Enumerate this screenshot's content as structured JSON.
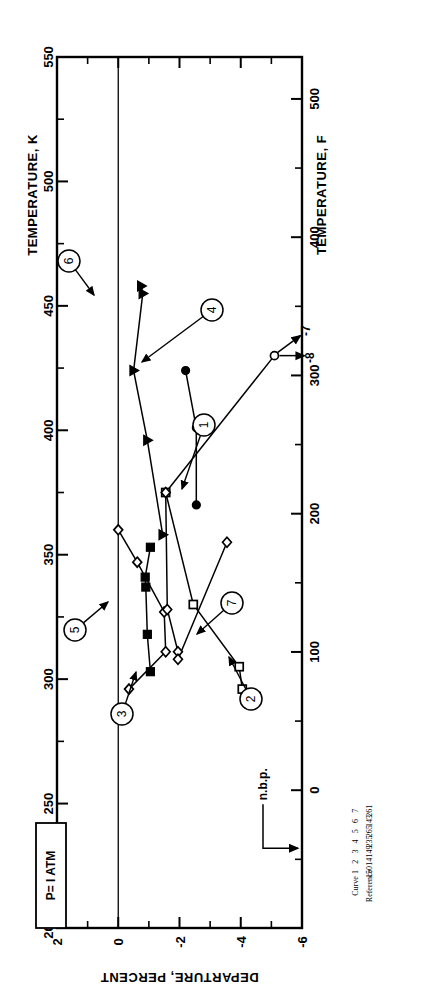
{
  "figure": {
    "orientation": "rotated-90-ccw",
    "pressure_note": "P= I ATM",
    "nbp_label": "n.b.p.",
    "extra_arrow_labels": [
      "-7",
      "-8"
    ]
  },
  "axes": {
    "kelvin": {
      "title": "TEMPERATURE, K",
      "ticks": [
        "200",
        "250",
        "300",
        "350",
        "400",
        "450",
        "500",
        "550"
      ],
      "min": 200,
      "max": 550,
      "minor_step": 25
    },
    "fahrenheit": {
      "title": "TEMPERATURE, F",
      "ticks": [
        "0",
        "100",
        "200",
        "300",
        "400",
        "500"
      ],
      "min": -100,
      "max": 530,
      "minor_step": 50
    },
    "departure": {
      "title": "DEPARTURE, PERCENT",
      "ticks": [
        "2",
        "0",
        "-2",
        "-4",
        "-6"
      ],
      "min": -6,
      "max": 2,
      "minor_step": 1
    }
  },
  "legend_table": {
    "headers": [
      "Curve",
      "Reference"
    ],
    "rows": [
      {
        "curve": "1",
        "reference": "150"
      },
      {
        "curve": "2",
        "reference": "14"
      },
      {
        "curve": "3",
        "reference": "149"
      },
      {
        "curve": "4",
        "reference": "235"
      },
      {
        "curve": "5",
        "reference": "265"
      },
      {
        "curve": "6",
        "reference": "143"
      },
      {
        "curve": "7",
        "reference": "261"
      }
    ]
  },
  "callouts": [
    {
      "id": "1",
      "label": "1"
    },
    {
      "id": "2",
      "label": "2"
    },
    {
      "id": "3",
      "label": "3"
    },
    {
      "id": "4",
      "label": "4"
    },
    {
      "id": "5",
      "label": "5"
    },
    {
      "id": "6",
      "label": "6"
    },
    {
      "id": "7",
      "label": "7"
    }
  ],
  "chart_data": {
    "type": "line",
    "title": "",
    "xlabel": "TEMPERATURE, K",
    "ylabel": "DEPARTURE, PERCENT",
    "xlim": [
      200,
      550
    ],
    "ylim": [
      -6,
      2
    ],
    "secondary_xlabel": "TEMPERATURE, F",
    "grid": false,
    "legend_position": "table-below-right",
    "annotations": [
      {
        "text": "P= I ATM",
        "x": 222,
        "y": 1.5
      },
      {
        "text": "n.b.p.",
        "x": 255,
        "y": -5.1
      },
      {
        "text": "-7",
        "x": 430,
        "y": -5.0
      },
      {
        "text": "-8",
        "x": 430,
        "y": -5.4
      }
    ],
    "series": [
      {
        "name": "1",
        "reference": "150",
        "marker": "open-circle",
        "points": [
          [
            375,
            -1.55
          ],
          [
            430,
            -5.1
          ]
        ]
      },
      {
        "name": "2",
        "reference": "14",
        "marker": "open-square",
        "points": [
          [
            375,
            -1.55
          ],
          [
            330,
            -2.45
          ],
          [
            305,
            -3.95
          ],
          [
            296,
            -4.05
          ],
          [
            293,
            -4.5
          ]
        ]
      },
      {
        "name": "3",
        "reference": "149",
        "marker": "open-diamond",
        "points": [
          [
            360,
            0.0
          ],
          [
            347,
            -0.62
          ],
          [
            327,
            -1.5
          ],
          [
            311,
            -1.55
          ],
          [
            296,
            -0.35
          ]
        ]
      },
      {
        "name": "4",
        "reference": "235",
        "marker": "filled-circle",
        "points": [
          [
            424,
            -2.2
          ],
          [
            401,
            -2.55
          ],
          [
            370,
            -2.55
          ]
        ]
      },
      {
        "name": "5",
        "reference": "265",
        "marker": "filled-square",
        "points": [
          [
            353,
            -1.05
          ],
          [
            341,
            -0.88
          ],
          [
            337,
            -0.9
          ],
          [
            318,
            -0.95
          ],
          [
            303,
            -1.05
          ]
        ]
      },
      {
        "name": "6",
        "reference": "143",
        "marker": "filled-triangle",
        "points": [
          [
            458,
            -0.75
          ],
          [
            455,
            -0.8
          ],
          [
            424,
            -0.5
          ],
          [
            396,
            -0.95
          ],
          [
            358,
            -1.45
          ]
        ]
      },
      {
        "name": "7",
        "reference": "261",
        "marker": "open-diamond",
        "points": [
          [
            375,
            -1.55
          ],
          [
            328,
            -1.6
          ],
          [
            311,
            -1.95
          ],
          [
            308,
            -1.95
          ],
          [
            355,
            -3.55
          ]
        ]
      }
    ],
    "reference_line": {
      "y": 0.0,
      "style": "solid"
    }
  }
}
